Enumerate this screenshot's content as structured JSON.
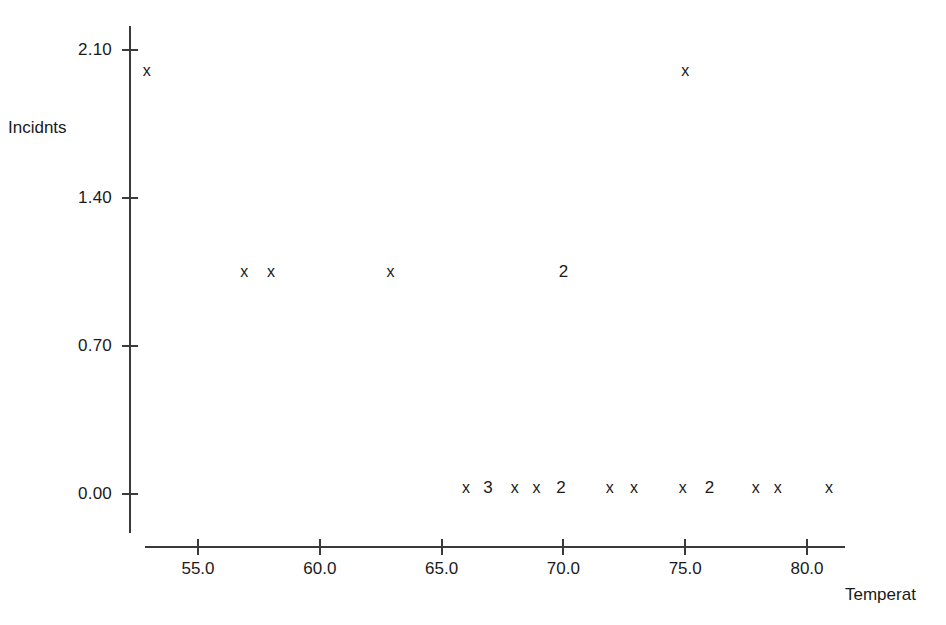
{
  "chart_data": {
    "type": "scatter",
    "title": "",
    "xlabel": "Temperat",
    "ylabel": "Incidnts",
    "xlim": [
      52.2,
      81.7
    ],
    "ylim": [
      -0.15,
      2.25
    ],
    "grid": false,
    "legend": null,
    "x_ticks": [
      {
        "label": "55.0",
        "value": 55.0
      },
      {
        "label": "60.0",
        "value": 60.0
      },
      {
        "label": "65.0",
        "value": 65.0
      },
      {
        "label": "70.0",
        "value": 70.0
      },
      {
        "label": "75.0",
        "value": 75.0
      },
      {
        "label": "80.0",
        "value": 80.0
      }
    ],
    "y_ticks": [
      {
        "label": "2.10",
        "value": 2.1
      },
      {
        "label": "1.40",
        "value": 1.4
      },
      {
        "label": "0.70",
        "value": 0.7
      },
      {
        "label": "0.00",
        "value": 0.0
      }
    ],
    "marker_symbol": "x",
    "points": [
      {
        "x": 52.9,
        "y": 2.0,
        "label": "x",
        "count": 1
      },
      {
        "x": 75.0,
        "y": 2.0,
        "label": "x",
        "count": 1
      },
      {
        "x": 56.9,
        "y": 1.05,
        "label": "x",
        "count": 1
      },
      {
        "x": 58.0,
        "y": 1.05,
        "label": "x",
        "count": 1
      },
      {
        "x": 62.9,
        "y": 1.05,
        "label": "x",
        "count": 1
      },
      {
        "x": 70.0,
        "y": 1.05,
        "label": "2",
        "count": 2
      },
      {
        "x": 66.0,
        "y": 0.03,
        "label": "x",
        "count": 1
      },
      {
        "x": 66.9,
        "y": 0.03,
        "label": "3",
        "count": 3
      },
      {
        "x": 68.0,
        "y": 0.03,
        "label": "x",
        "count": 1
      },
      {
        "x": 68.9,
        "y": 0.03,
        "label": "x",
        "count": 1
      },
      {
        "x": 69.9,
        "y": 0.03,
        "label": "2",
        "count": 2
      },
      {
        "x": 71.9,
        "y": 0.03,
        "label": "x",
        "count": 1
      },
      {
        "x": 72.9,
        "y": 0.03,
        "label": "x",
        "count": 1
      },
      {
        "x": 74.9,
        "y": 0.03,
        "label": "x",
        "count": 1
      },
      {
        "x": 76.0,
        "y": 0.03,
        "label": "2",
        "count": 2
      },
      {
        "x": 77.9,
        "y": 0.03,
        "label": "x",
        "count": 1
      },
      {
        "x": 78.8,
        "y": 0.03,
        "label": "x",
        "count": 1
      },
      {
        "x": 80.9,
        "y": 0.03,
        "label": "x",
        "count": 1
      }
    ]
  },
  "colors": {
    "axis": "#3a3a3a",
    "text": "#1a1a1a",
    "marker": "#1a1a1a",
    "background": "#ffffff"
  }
}
